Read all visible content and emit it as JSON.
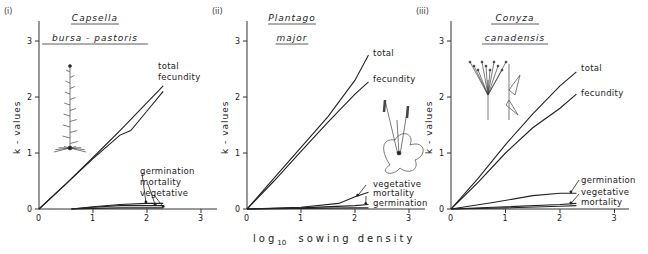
{
  "figure": {
    "x_axis_label_prefix": "log",
    "x_axis_label_sub": "10",
    "x_axis_label_suffix": "sowing density",
    "y_axis_label": "k - values"
  },
  "chart_data": [
    {
      "type": "line",
      "panel": "(i)",
      "title": "Capsella bursa - pastoris",
      "title_lines": [
        "Capsella",
        "bursa - pastoris"
      ],
      "xlabel": "log10 sowing density",
      "ylabel": "k - values",
      "xlim": [
        0,
        3.3
      ],
      "ylim": [
        0,
        3.3
      ],
      "xticks": [
        0,
        1,
        2,
        3
      ],
      "yticks": [
        0,
        1,
        2,
        3
      ],
      "grid": false,
      "series": [
        {
          "name": "total",
          "x": [
            0,
            0.5,
            1.0,
            1.5,
            2.0,
            2.3
          ],
          "y": [
            0,
            0.45,
            0.92,
            1.4,
            1.9,
            2.2
          ]
        },
        {
          "name": "fecundity",
          "x": [
            0,
            0.5,
            1.0,
            1.5,
            1.7,
            2.0,
            2.3
          ],
          "y": [
            0,
            0.45,
            0.9,
            1.32,
            1.4,
            1.75,
            2.1
          ]
        },
        {
          "name": "germination",
          "x": [
            0.6,
            1.0,
            1.5,
            2.0,
            2.3
          ],
          "y": [
            0,
            0.04,
            0.08,
            0.1,
            0.1
          ]
        },
        {
          "name": "mortality",
          "x": [
            0.6,
            1.0,
            1.5,
            2.0,
            2.3
          ],
          "y": [
            0,
            0.03,
            0.06,
            0.06,
            0.06
          ]
        },
        {
          "name": "vegetative",
          "x": [
            0.6,
            1.0,
            1.5,
            2.0,
            2.3
          ],
          "y": [
            0,
            0.01,
            0.02,
            0.02,
            0.02
          ]
        }
      ]
    },
    {
      "type": "line",
      "panel": "(ii)",
      "title": "Plantago major",
      "title_lines": [
        "Plantago",
        "major"
      ],
      "xlabel": "log10 sowing density",
      "ylabel": "k - values",
      "xlim": [
        0,
        3.3
      ],
      "ylim": [
        0,
        3.3
      ],
      "xticks": [
        0,
        1,
        2,
        3
      ],
      "yticks": [
        0,
        1,
        2,
        3
      ],
      "grid": false,
      "series": [
        {
          "name": "total",
          "x": [
            0,
            0.5,
            1.0,
            1.5,
            2.0,
            2.25
          ],
          "y": [
            0,
            0.55,
            1.1,
            1.65,
            2.3,
            2.75
          ]
        },
        {
          "name": "fecundity",
          "x": [
            0,
            0.5,
            1.0,
            1.5,
            2.0,
            2.25
          ],
          "y": [
            0,
            0.5,
            1.03,
            1.55,
            2.05,
            2.27
          ]
        },
        {
          "name": "vegetative",
          "x": [
            0,
            1.0,
            1.7,
            2.0,
            2.25
          ],
          "y": [
            0,
            0.03,
            0.1,
            0.22,
            0.3
          ]
        },
        {
          "name": "mortality",
          "x": [
            0,
            1.0,
            2.0,
            2.25
          ],
          "y": [
            0,
            0.02,
            0.06,
            0.08
          ]
        },
        {
          "name": "germination",
          "x": [
            0,
            1.0,
            2.0,
            2.25
          ],
          "y": [
            0,
            0.01,
            0.02,
            0.02
          ]
        }
      ]
    },
    {
      "type": "line",
      "panel": "(iii)",
      "title": "Conyza canadensis",
      "title_lines": [
        "Conyza",
        "canadensis"
      ],
      "xlabel": "log10 sowing density",
      "ylabel": "k - values",
      "xlim": [
        0,
        3.3
      ],
      "ylim": [
        0,
        3.3
      ],
      "xticks": [
        0,
        1,
        2,
        3
      ],
      "yticks": [
        0,
        1,
        2,
        3
      ],
      "grid": false,
      "series": [
        {
          "name": "total",
          "x": [
            0,
            0.5,
            1.0,
            1.5,
            2.0,
            2.3
          ],
          "y": [
            0,
            0.55,
            1.15,
            1.7,
            2.2,
            2.45
          ]
        },
        {
          "name": "fecundity",
          "x": [
            0,
            0.5,
            1.0,
            1.5,
            2.0,
            2.3
          ],
          "y": [
            0,
            0.48,
            1.0,
            1.45,
            1.8,
            2.05
          ]
        },
        {
          "name": "germination",
          "x": [
            0,
            0.8,
            1.5,
            2.0,
            2.3
          ],
          "y": [
            0,
            0.12,
            0.24,
            0.28,
            0.28
          ]
        },
        {
          "name": "vegetative",
          "x": [
            0,
            1.0,
            2.0,
            2.3
          ],
          "y": [
            0,
            0.04,
            0.08,
            0.1
          ]
        },
        {
          "name": "mortality",
          "x": [
            0,
            1.0,
            2.0,
            2.3
          ],
          "y": [
            0,
            0.02,
            0.05,
            0.06
          ]
        }
      ]
    }
  ]
}
